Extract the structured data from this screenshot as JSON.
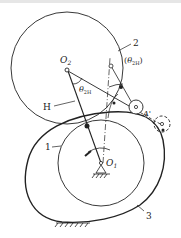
{
  "diagram": {
    "labels": {
      "o2": "O",
      "o2_sub": "2",
      "o1": "O",
      "o1_sub": "1",
      "gear2": "2",
      "theta_paren_open": "(",
      "theta_paren_theta": "θ",
      "theta_paren_sub": "2H",
      "theta_paren_close": ")",
      "theta": "θ",
      "theta_sub": "2H",
      "arm": "H",
      "point_a": "A",
      "point_a_prime": "'",
      "gear1": "1",
      "gear3": "3"
    },
    "colors": {
      "stroke": "#222222",
      "background": "#ffffff"
    }
  }
}
